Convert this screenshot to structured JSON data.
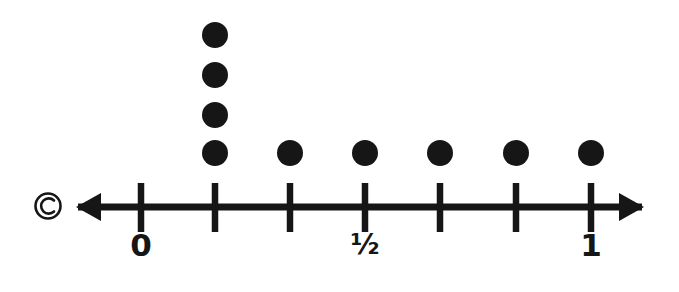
{
  "figure": {
    "copyright_mark": "©",
    "background_color": "#ffffff",
    "ink_color": "#161616"
  },
  "axis": {
    "type": "number-line",
    "left_arrow": true,
    "right_arrow": true,
    "line_y": 207,
    "line_start_x": 78,
    "line_end_x": 642,
    "tick_count": 7,
    "tick_positions_px": [
      141,
      215,
      290,
      365,
      440,
      516,
      591
    ],
    "tick_values": [
      0,
      0.125,
      0.25,
      0.5,
      0.625,
      0.75,
      1
    ],
    "labels": [
      {
        "text": "0",
        "x": 141,
        "y": 247,
        "value": 0
      },
      {
        "text": "½",
        "x": 365,
        "y": 247,
        "value": 0.5
      },
      {
        "text": "1",
        "x": 591,
        "y": 247,
        "value": 1
      }
    ]
  },
  "chart_data": {
    "type": "scatter",
    "xlabel": "",
    "ylabel": "",
    "xlim": [
      0,
      1
    ],
    "grid": false,
    "legend": null,
    "tick_labels": [
      "0",
      "",
      "",
      "½",
      "",
      "",
      "1"
    ],
    "categories": [
      "t1",
      "t2",
      "t3",
      "t4",
      "t5",
      "t6"
    ],
    "x": [
      215,
      290,
      365,
      440,
      516,
      591
    ],
    "values": [
      4,
      1,
      1,
      1,
      1,
      1
    ],
    "dot_radius_px": 13,
    "dot_stack_spacing_px": 38,
    "dot_base_y_px": 153,
    "dots": [
      {
        "x": 215,
        "y": 153
      },
      {
        "x": 215,
        "y": 115
      },
      {
        "x": 215,
        "y": 75
      },
      {
        "x": 215,
        "y": 35
      },
      {
        "x": 290,
        "y": 153
      },
      {
        "x": 365,
        "y": 153
      },
      {
        "x": 440,
        "y": 153
      },
      {
        "x": 516,
        "y": 153
      },
      {
        "x": 591,
        "y": 153
      }
    ]
  }
}
